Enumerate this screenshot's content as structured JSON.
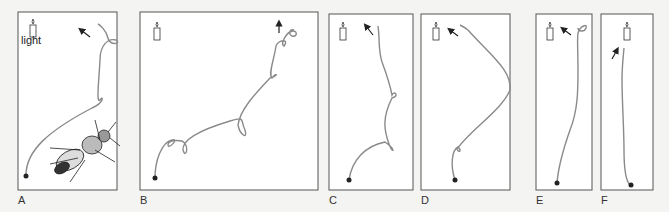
{
  "figure": {
    "candle_label": "light",
    "panels": [
      {
        "id": "A",
        "label": "A",
        "has_fly": true
      },
      {
        "id": "B",
        "label": "B"
      },
      {
        "id": "C",
        "label": "C"
      },
      {
        "id": "D",
        "label": "D"
      },
      {
        "id": "E",
        "label": "E"
      },
      {
        "id": "F",
        "label": "F"
      }
    ],
    "colors": {
      "path": "#8a8a8a",
      "frame": "#555555",
      "background": "#ffffff"
    }
  }
}
